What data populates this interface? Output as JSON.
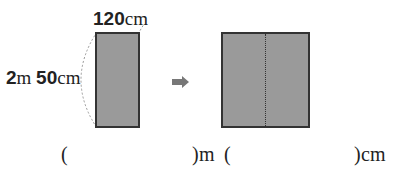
{
  "figure": {
    "left_rect": {
      "width_label": {
        "num": "120",
        "unit": "cm"
      },
      "height_label": {
        "num1": "2",
        "unit1": "m",
        "num2": "50",
        "unit2": "cm"
      }
    },
    "arrow": "➡",
    "right_rect": {
      "fold_line": "dotted-vertical"
    }
  },
  "answer": {
    "open1": "(",
    "close1": ")",
    "unit1": "m",
    "open2": "(",
    "close2": ")",
    "unit2": "cm"
  },
  "colors": {
    "fill": "#9a9a9a",
    "border": "#333333",
    "arrow": "#777777"
  }
}
